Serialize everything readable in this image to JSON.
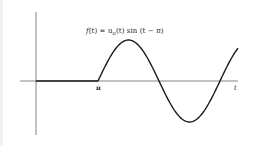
{
  "chart_data": {
    "type": "line",
    "title": "",
    "annotation": "f(t) = u_π(t) sin(t − π)",
    "xlabel": "t",
    "ylabel": "",
    "x_tick_labels": [
      "π"
    ],
    "grid": false,
    "legend": null,
    "series": [
      {
        "name": "f(t) = u_π(t) sin(t − π)",
        "description": "zero for 0 ≤ t < π, then sin(t − π) for t ≥ π",
        "x": [
          0,
          1.571,
          3.1416,
          3.927,
          4.712,
          5.498,
          6.283,
          7.069,
          7.854,
          8.639,
          9.425,
          9.8
        ],
        "y": [
          0,
          0,
          0,
          0.707,
          1,
          0.707,
          0,
          -0.707,
          -1,
          -0.707,
          0,
          0.36
        ]
      }
    ],
    "xlim": [
      0,
      9.8
    ],
    "ylim": [
      -1.3,
      1.6
    ],
    "colors": {
      "curve": "#1a1a1a",
      "axes": "#555555"
    }
  },
  "labels": {
    "formula_f": "f",
    "formula_mid": "(t) = u",
    "formula_sub": "π",
    "formula_end": "(t) sin (t − π)",
    "pi_tick": "π",
    "t_axis": "t"
  }
}
